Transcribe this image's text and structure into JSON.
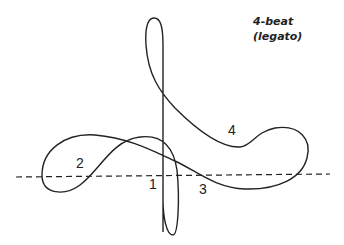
{
  "title": {
    "line1": "4-beat",
    "line2": "(legato)"
  },
  "beats": [
    {
      "label": "1",
      "x": 149,
      "y": 176
    },
    {
      "label": "2",
      "x": 76,
      "y": 155
    },
    {
      "label": "3",
      "x": 199,
      "y": 181
    },
    {
      "label": "4",
      "x": 228,
      "y": 122
    }
  ],
  "colors": {
    "stroke": "#222222",
    "background": "#ffffff"
  }
}
